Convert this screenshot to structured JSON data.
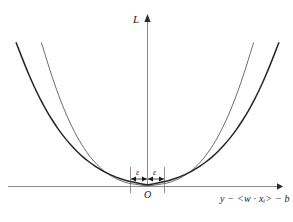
{
  "figure": {
    "title": "",
    "axes": {
      "y_axis_label": "L",
      "x_axis_label": "y − <w · xᵢ> − b",
      "origin_label": "O"
    },
    "annotations": {
      "epsilon_left": "ε",
      "epsilon_right": "ε"
    },
    "colors": {
      "axis": "#808080",
      "curve_outer": "#2b2b2b",
      "curve_inner": "#555555",
      "text": "#1a1a1a",
      "background": "#ffffff"
    }
  },
  "chart_data": {
    "type": "line",
    "title": "",
    "xlabel": "y − <w · xᵢ> − b",
    "ylabel": "L",
    "xlim": [
      -1.35,
      1.35
    ],
    "ylim": [
      0,
      1.0
    ],
    "grid": false,
    "legend": null,
    "annotations": [
      {
        "text": "ε",
        "x": -0.085,
        "y": 0.075,
        "role": "epsilon-left-span"
      },
      {
        "text": "ε",
        "x": 0.085,
        "y": 0.075,
        "role": "epsilon-right-span"
      },
      {
        "text": "O",
        "x": 0.0,
        "y": -0.06,
        "role": "origin"
      }
    ],
    "epsilon": 0.17,
    "series": [
      {
        "name": "outer-loss-curve",
        "style": "solid-thick",
        "x": [
          -1.3,
          -1.24,
          -1.18,
          -1.12,
          -1.06,
          -1.0,
          -0.94,
          -0.88,
          -0.82,
          -0.76,
          -0.7,
          -0.64,
          -0.58,
          -0.52,
          -0.46,
          -0.4,
          -0.34,
          -0.28,
          -0.22,
          -0.17,
          0.0,
          0.17,
          0.22,
          0.28,
          0.34,
          0.4,
          0.46,
          0.52,
          0.58,
          0.64,
          0.7,
          0.76,
          0.82,
          0.88,
          0.94,
          1.0,
          1.06,
          1.12,
          1.18,
          1.24,
          1.3
        ],
        "y": [
          0.965,
          0.86,
          0.76,
          0.668,
          0.585,
          0.51,
          0.443,
          0.382,
          0.328,
          0.28,
          0.237,
          0.199,
          0.166,
          0.137,
          0.112,
          0.09,
          0.071,
          0.055,
          0.042,
          0.034,
          0.012,
          0.034,
          0.042,
          0.055,
          0.071,
          0.09,
          0.112,
          0.137,
          0.166,
          0.199,
          0.237,
          0.28,
          0.328,
          0.382,
          0.443,
          0.51,
          0.585,
          0.668,
          0.76,
          0.86,
          0.965
        ]
      },
      {
        "name": "inner-loss-curve",
        "style": "solid-thin",
        "x": [
          -1.05,
          -1.0,
          -0.95,
          -0.9,
          -0.85,
          -0.8,
          -0.75,
          -0.7,
          -0.65,
          -0.6,
          -0.55,
          -0.5,
          -0.45,
          -0.4,
          -0.35,
          -0.3,
          -0.25,
          -0.2,
          -0.17,
          0.0,
          0.17,
          0.2,
          0.25,
          0.3,
          0.35,
          0.4,
          0.45,
          0.5,
          0.55,
          0.6,
          0.65,
          0.7,
          0.75,
          0.8,
          0.85,
          0.9,
          0.95,
          1.0,
          1.05
        ],
        "y": [
          0.965,
          0.855,
          0.748,
          0.65,
          0.56,
          0.478,
          0.404,
          0.338,
          0.28,
          0.229,
          0.185,
          0.147,
          0.115,
          0.089,
          0.067,
          0.049,
          0.035,
          0.024,
          0.02,
          0.006,
          0.02,
          0.024,
          0.035,
          0.049,
          0.067,
          0.089,
          0.115,
          0.147,
          0.185,
          0.229,
          0.28,
          0.338,
          0.404,
          0.478,
          0.56,
          0.65,
          0.748,
          0.855,
          0.965
        ]
      }
    ]
  }
}
